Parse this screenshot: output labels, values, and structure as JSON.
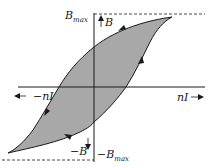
{
  "diagram": {
    "type": "hysteresis-loop",
    "labels": {
      "b_max": "B",
      "b_max_sub": "max",
      "b": "B",
      "neg_b": "−B",
      "neg_b_max": "−B",
      "neg_b_max_sub": "max",
      "ni": "nI",
      "neg_ni": "−nI"
    },
    "colors": {
      "loop_fill": "#a8a8a8",
      "stroke": "#1a1a1a",
      "background": "#ffffff"
    },
    "axes": {
      "horizontal": "nI",
      "vertical": "B"
    }
  }
}
